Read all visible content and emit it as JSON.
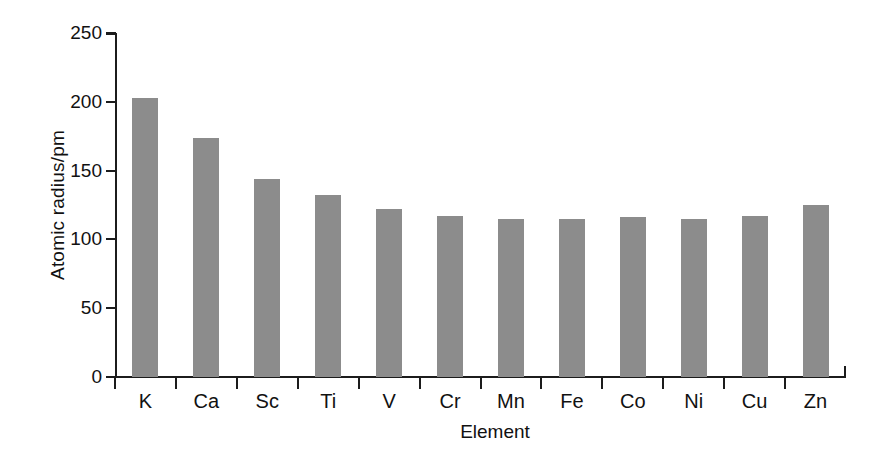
{
  "chart_data": {
    "type": "bar",
    "title": "",
    "subtitle": "",
    "xlabel": "Element",
    "ylabel": "Atomic radius/pm",
    "categories": [
      "K",
      "Ca",
      "Sc",
      "Ti",
      "V",
      "Cr",
      "Mn",
      "Fe",
      "Co",
      "Ni",
      "Cu",
      "Zn"
    ],
    "values": [
      203,
      174,
      144,
      132,
      122,
      117,
      115,
      115,
      116,
      115,
      117,
      125
    ],
    "ylim": [
      0,
      250
    ],
    "yticks": [
      0,
      50,
      100,
      150,
      200,
      250
    ],
    "ytick_labels": [
      "0",
      "50",
      "100",
      "150",
      "200",
      "250"
    ],
    "xlim_categories": 12,
    "grid": false,
    "legend": false,
    "legend_position": "none",
    "series": [
      {
        "name": "Atomic radius",
        "values": [
          203,
          174,
          144,
          132,
          122,
          117,
          115,
          115,
          116,
          115,
          117,
          125
        ]
      }
    ],
    "colors": {
      "bar_fill": "#8c8c8c",
      "axis": "#1c1c1c",
      "text": "#111111",
      "background": "#ffffff"
    }
  }
}
